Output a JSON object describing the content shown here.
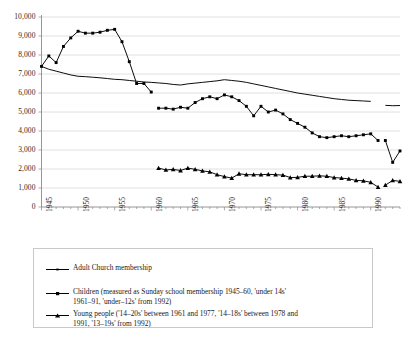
{
  "chart_data": {
    "type": "line",
    "title": "",
    "xlabel": "",
    "ylabel": "",
    "ylim": [
      0,
      10000
    ],
    "ytick_labels": [
      "10,000",
      "9,000",
      "8,000",
      "7,000",
      "6,000",
      "5,000",
      "4,000",
      "3,000",
      "2,000",
      "1,000",
      "0"
    ],
    "ytick_values": [
      10000,
      9000,
      8000,
      7000,
      6000,
      5000,
      4000,
      3000,
      2000,
      1000,
      0
    ],
    "xlim": [
      1945,
      1994
    ],
    "xtick_labels": [
      "1945",
      "1950",
      "1955",
      "1960",
      "1965",
      "1970",
      "1975",
      "1980",
      "1985",
      "1990"
    ],
    "xtick_values": [
      1945,
      1950,
      1955,
      1960,
      1965,
      1970,
      1975,
      1980,
      1985,
      1990
    ],
    "grid": "horizontal",
    "legend_position": "below",
    "series": [
      {
        "name": "Adult Church membership",
        "marker": "none",
        "segments": [
          {
            "x": [
              1945,
              1946,
              1947,
              1948,
              1949,
              1950,
              1951,
              1952,
              1953,
              1954,
              1955,
              1956,
              1957,
              1958,
              1959,
              1960,
              1961,
              1962,
              1963,
              1964,
              1965,
              1966,
              1967,
              1968,
              1969,
              1970,
              1971,
              1972,
              1973,
              1974,
              1975,
              1976,
              1977,
              1978,
              1979,
              1980,
              1981,
              1982,
              1983,
              1984,
              1985,
              1986,
              1987,
              1988,
              1989,
              1990
            ],
            "y": [
              7400,
              7250,
              7150,
              7050,
              6950,
              6880,
              6860,
              6830,
              6800,
              6760,
              6720,
              6700,
              6660,
              6620,
              6580,
              6560,
              6530,
              6500,
              6450,
              6420,
              6480,
              6520,
              6560,
              6600,
              6640,
              6700,
              6660,
              6620,
              6560,
              6480,
              6400,
              6320,
              6240,
              6160,
              6080,
              6000,
              5940,
              5880,
              5820,
              5760,
              5700,
              5660,
              5620,
              5600,
              5580,
              5560
            ]
          },
          {
            "x": [
              1992,
              1993,
              1994
            ],
            "y": [
              5350,
              5330,
              5340
            ]
          }
        ]
      },
      {
        "name": "Children (measured as Sunday school membership 1945–60, 'under 14s' 1961–91, 'under–12s' from 1992)",
        "marker": "square",
        "segments": [
          {
            "x": [
              1945,
              1946,
              1947,
              1948,
              1949,
              1950,
              1951,
              1952,
              1953,
              1954,
              1955,
              1956,
              1957,
              1958,
              1959,
              1960
            ],
            "y": [
              7400,
              7950,
              7600,
              8450,
              8900,
              9250,
              9150,
              9150,
              9200,
              9300,
              9350,
              8700,
              7650,
              6500,
              6500,
              6050
            ]
          },
          {
            "x": [
              1961,
              1962,
              1963,
              1964,
              1965,
              1966,
              1967,
              1968,
              1969,
              1970,
              1971,
              1972,
              1973,
              1974,
              1975,
              1976,
              1977,
              1978,
              1979,
              1980,
              1981,
              1982,
              1983,
              1984,
              1985,
              1986,
              1987,
              1988,
              1989,
              1990,
              1991
            ],
            "y": [
              5200,
              5200,
              5150,
              5250,
              5200,
              5500,
              5700,
              5800,
              5700,
              5900,
              5800,
              5600,
              5300,
              4800,
              5300,
              5000,
              5100,
              4900,
              4600,
              4400,
              4200,
              3900,
              3700,
              3650,
              3700,
              3750,
              3700,
              3750,
              3800,
              3850,
              3500
            ]
          },
          {
            "x": [
              1992,
              1993,
              1994
            ],
            "y": [
              3500,
              2350,
              2950
            ]
          }
        ]
      },
      {
        "name": "Young people ('14–20s' between 1961 and 1977, '14–18s' between 1978 and 1991, '13–19s' from 1992)",
        "marker": "triangle",
        "segments": [
          {
            "x": [
              1961,
              1962,
              1963,
              1964,
              1965,
              1966,
              1967,
              1968,
              1969,
              1970,
              1971,
              1972,
              1973,
              1974,
              1975,
              1976,
              1977,
              1978,
              1979,
              1980,
              1981,
              1982,
              1983,
              1984,
              1985,
              1986,
              1987,
              1988,
              1989,
              1990,
              1991
            ],
            "y": [
              2050,
              1950,
              1980,
              1920,
              2050,
              1980,
              1900,
              1850,
              1700,
              1600,
              1520,
              1750,
              1700,
              1700,
              1700,
              1720,
              1700,
              1680,
              1550,
              1560,
              1620,
              1620,
              1640,
              1620,
              1550,
              1520,
              1480,
              1400,
              1380,
              1300,
              1050
            ]
          },
          {
            "x": [
              1992,
              1993,
              1994
            ],
            "y": [
              1150,
              1400,
              1350
            ]
          }
        ]
      }
    ]
  },
  "legend": {
    "items": [
      {
        "key": "line-plain",
        "label": "Adult Church membership"
      },
      {
        "key": "line-square",
        "label": "Children (measured as Sunday school membership 1945–60, 'under 14s'\n1961–91, 'under–12s' from 1992)"
      },
      {
        "key": "line-triangle",
        "label": "Young people ('14–20s' between 1961 and 1977, '14–18s' between 1978 and\n1991, '13–19s' from 1992)"
      }
    ]
  },
  "colors": {
    "series": "#000000",
    "grid": "#d8d8d8",
    "axis": "#8a8a8a",
    "text": "#1a1a1a",
    "legend_border": "#c9c9c9"
  }
}
